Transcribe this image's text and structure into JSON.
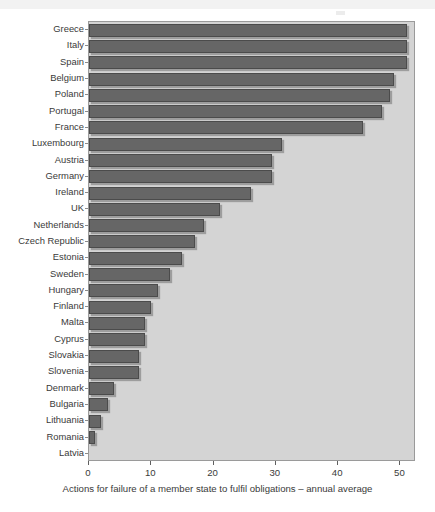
{
  "chart_data": {
    "type": "bar",
    "orientation": "horizontal",
    "title": "",
    "subtitle": "",
    "xlabel": "Actions for failure of a member state to fulfil obligations – annual average",
    "ylabel": "",
    "xlim": [
      0,
      52.5
    ],
    "xticks": [
      0,
      10,
      20,
      30,
      40,
      50
    ],
    "xticklabels": [
      "0",
      "10",
      "20",
      "30",
      "40",
      "50"
    ],
    "grid": false,
    "legend": null,
    "categories": [
      "Greece",
      "Italy",
      "Spain",
      "Belgium",
      "Poland",
      "Portugal",
      "France",
      "Luxembourg",
      "Austria",
      "Germany",
      "Ireland",
      "UK",
      "Netherlands",
      "Czech Republic",
      "Estonia",
      "Sweden",
      "Hungary",
      "Finland",
      "Malta",
      "Cyprus",
      "Slovakia",
      "Slovenia",
      "Denmark",
      "Bulgaria",
      "Lithuania",
      "Romania",
      "Latvia"
    ],
    "values": [
      51,
      51,
      51,
      49,
      48.4,
      47,
      44,
      31,
      29.4,
      29.4,
      26,
      21,
      18.5,
      17,
      15,
      13,
      11,
      10,
      9,
      9,
      8,
      8,
      4,
      3,
      2,
      1,
      0
    ],
    "series": [
      {
        "name": "Actions for failure of a member state to fulfil obligations – annual average",
        "values": [
          51,
          51,
          51,
          49,
          48.4,
          47,
          44,
          31,
          29.4,
          29.4,
          26,
          21,
          18.5,
          17,
          15,
          13,
          11,
          10,
          9,
          9,
          8,
          8,
          4,
          3,
          2,
          1,
          0
        ]
      }
    ]
  },
  "style": {
    "bar_fill": "#666666",
    "bar_edge": "#4b4b4b",
    "plot_background": "#d4d4d4",
    "plot_border": "#9a9a9a",
    "page_background": "#ffffff",
    "text_color": "#3a3a3a"
  }
}
